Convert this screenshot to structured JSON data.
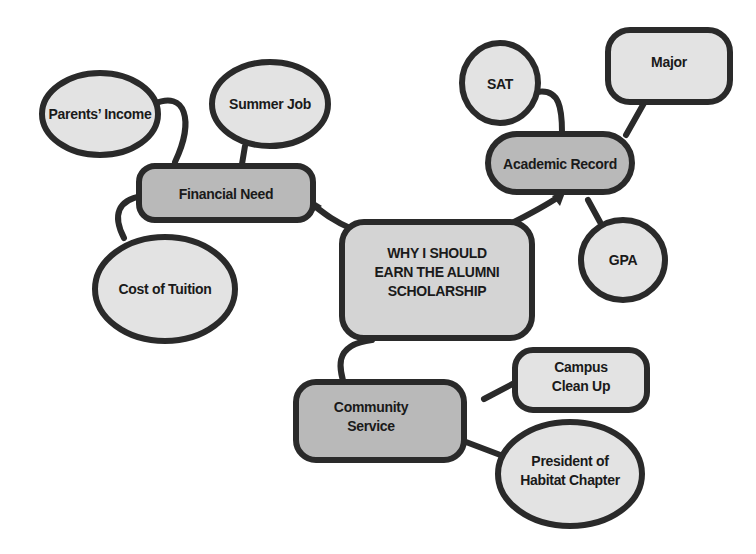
{
  "diagram": {
    "type": "mind-map",
    "colors": {
      "outline": "#2a2a2a",
      "main_node_fill": "#b9b9b9",
      "sub_node_fill": "#e3e3e3",
      "background": "#ffffff"
    },
    "center": {
      "line1": "WHY I SHOULD",
      "line2": "EARN THE ALUMNI",
      "line3": "SCHOLARSHIP"
    },
    "branches": [
      {
        "label": "Financial Need",
        "children": [
          "Parents’ Income",
          "Summer Job",
          "Cost of Tuition"
        ]
      },
      {
        "label": "Academic Record",
        "children": [
          "SAT",
          "Major",
          "GPA"
        ]
      },
      {
        "label_line1": "Community",
        "label_line2": "Service",
        "children": [
          {
            "line1": "Campus",
            "line2": "Clean Up"
          },
          {
            "line1": "President of",
            "line2": "Habitat Chapter"
          }
        ]
      }
    ]
  }
}
